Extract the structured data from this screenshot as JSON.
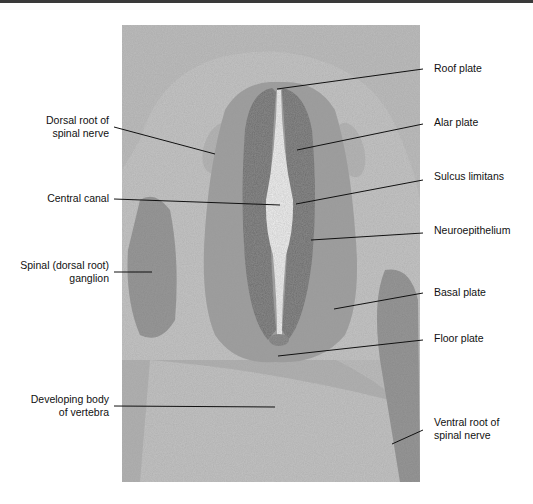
{
  "figure": {
    "colors": {
      "photo_bg": "#b9b9b9",
      "tissue_light": "#c7c7c7",
      "tissue_mid": "#9a9a9a",
      "neuroepithelium": "#6e6e6e",
      "canal": "#f2f2f2",
      "leader_line": "#111111",
      "top_bar": "#3a3a3a"
    }
  },
  "labels": {
    "left": [
      {
        "id": "dorsal-root",
        "lines": [
          "Dorsal root of",
          "spinal nerve"
        ]
      },
      {
        "id": "central-canal",
        "lines": [
          "Central canal"
        ]
      },
      {
        "id": "spinal-ganglion",
        "lines": [
          "Spinal (dorsal root)",
          "ganglion"
        ]
      },
      {
        "id": "vertebra-body",
        "lines": [
          "Developing body",
          "of vertebra"
        ]
      }
    ],
    "right": [
      {
        "id": "roof-plate",
        "lines": [
          "Roof plate"
        ]
      },
      {
        "id": "alar-plate",
        "lines": [
          "Alar plate"
        ]
      },
      {
        "id": "sulcus-limitans",
        "lines": [
          "Sulcus limitans"
        ]
      },
      {
        "id": "neuroepithelium",
        "lines": [
          "Neuroepithelium"
        ]
      },
      {
        "id": "basal-plate",
        "lines": [
          "Basal plate"
        ]
      },
      {
        "id": "floor-plate",
        "lines": [
          "Floor plate"
        ]
      },
      {
        "id": "ventral-root",
        "lines": [
          "Ventral root of",
          "spinal nerve"
        ]
      }
    ]
  }
}
